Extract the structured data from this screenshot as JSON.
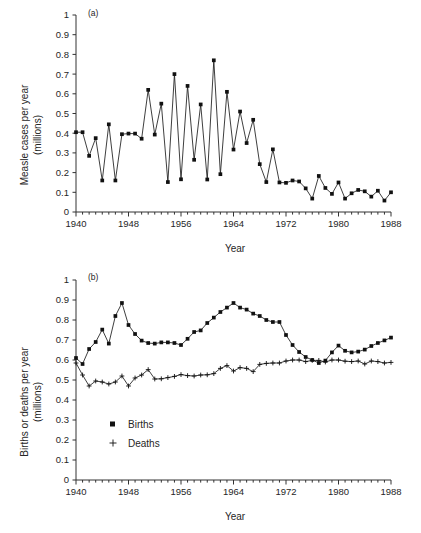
{
  "figure": {
    "width": 421,
    "height": 533,
    "background": "#ffffff",
    "ink_color": "#1c1c1c"
  },
  "panel_a": {
    "tag": "(a)",
    "ylabel_line1": "Measle cases per year",
    "ylabel_line2": "(millions)",
    "xlabel": "Year",
    "ytick_labels": [
      "0",
      "0.1",
      "0.2",
      "0.3",
      "0.4",
      "0.5",
      "0.6",
      "0.7",
      "0.8",
      "0.9",
      "1"
    ],
    "xtick_labels": [
      "1940",
      "1948",
      "1956",
      "1964",
      "1972",
      "1980",
      "1988"
    ]
  },
  "panel_b": {
    "tag": "(b)",
    "ylabel_line1": "Births or deaths per year",
    "ylabel_line2": "(millions)",
    "xlabel": "Year",
    "ytick_labels": [
      "0",
      "0.1",
      "0.2",
      "0.3",
      "0.4",
      "0.5",
      "0.6",
      "0.7",
      "0.8",
      "0.9",
      "1"
    ],
    "xtick_labels": [
      "1940",
      "1948",
      "1956",
      "1964",
      "1972",
      "1980",
      "1988"
    ],
    "legend": [
      {
        "label": "Births",
        "marker": "square"
      },
      {
        "label": "Deaths",
        "marker": "plus"
      }
    ]
  },
  "chart_data": [
    {
      "type": "line",
      "title": "(a) Measles cases per year",
      "xlabel": "Year",
      "ylabel": "Measle cases per year (millions)",
      "xlim": [
        1940,
        1988
      ],
      "ylim": [
        0,
        1
      ],
      "grid": false,
      "legend_position": "none",
      "marker": "filled-square",
      "x": [
        1940,
        1941,
        1942,
        1943,
        1944,
        1945,
        1946,
        1947,
        1948,
        1949,
        1950,
        1951,
        1952,
        1953,
        1954,
        1955,
        1956,
        1957,
        1958,
        1959,
        1960,
        1961,
        1962,
        1963,
        1964,
        1965,
        1966,
        1967,
        1968,
        1969,
        1970,
        1971,
        1972,
        1973,
        1974,
        1975,
        1976,
        1977,
        1978,
        1979,
        1980,
        1981,
        1982,
        1983,
        1984,
        1985,
        1986,
        1987,
        1988
      ],
      "series": [
        {
          "name": "Measles cases",
          "values": [
            0.405,
            0.405,
            0.285,
            0.375,
            0.16,
            0.445,
            0.16,
            0.395,
            0.398,
            0.398,
            0.372,
            0.62,
            0.393,
            0.55,
            0.152,
            0.7,
            0.166,
            0.64,
            0.265,
            0.546,
            0.165,
            0.77,
            0.192,
            0.61,
            0.317,
            0.51,
            0.35,
            0.468,
            0.243,
            0.152,
            0.318,
            0.15,
            0.148,
            0.16,
            0.155,
            0.12,
            0.068,
            0.183,
            0.122,
            0.092,
            0.15,
            0.068,
            0.095,
            0.112,
            0.105,
            0.078,
            0.108,
            0.058,
            0.1
          ]
        }
      ]
    },
    {
      "type": "line",
      "title": "(b) Births or deaths per year",
      "xlabel": "Year",
      "ylabel": "Births or deaths per year (millions)",
      "xlim": [
        1940,
        1988
      ],
      "ylim": [
        0,
        1
      ],
      "grid": false,
      "legend_position": "inside-left",
      "x": [
        1940,
        1941,
        1942,
        1943,
        1944,
        1945,
        1946,
        1947,
        1948,
        1949,
        1950,
        1951,
        1952,
        1953,
        1954,
        1955,
        1956,
        1957,
        1958,
        1959,
        1960,
        1961,
        1962,
        1963,
        1964,
        1965,
        1966,
        1967,
        1968,
        1969,
        1970,
        1971,
        1972,
        1973,
        1974,
        1975,
        1976,
        1977,
        1978,
        1979,
        1980,
        1981,
        1982,
        1983,
        1984,
        1985,
        1986,
        1987,
        1988
      ],
      "series": [
        {
          "name": "Births",
          "marker": "filled-square",
          "values": [
            0.61,
            0.58,
            0.655,
            0.69,
            0.752,
            0.682,
            0.82,
            0.885,
            0.775,
            0.73,
            0.697,
            0.685,
            0.682,
            0.688,
            0.688,
            0.685,
            0.675,
            0.706,
            0.74,
            0.748,
            0.785,
            0.812,
            0.84,
            0.862,
            0.885,
            0.862,
            0.852,
            0.832,
            0.82,
            0.8,
            0.79,
            0.79,
            0.725,
            0.675,
            0.64,
            0.615,
            0.6,
            0.585,
            0.597,
            0.638,
            0.672,
            0.646,
            0.638,
            0.642,
            0.652,
            0.67,
            0.685,
            0.698,
            0.712
          ]
        },
        {
          "name": "Deaths",
          "marker": "plus",
          "values": [
            0.585,
            0.525,
            0.47,
            0.495,
            0.49,
            0.48,
            0.49,
            0.52,
            0.47,
            0.51,
            0.525,
            0.552,
            0.505,
            0.506,
            0.512,
            0.518,
            0.527,
            0.522,
            0.52,
            0.525,
            0.526,
            0.532,
            0.558,
            0.572,
            0.545,
            0.562,
            0.558,
            0.542,
            0.578,
            0.583,
            0.585,
            0.585,
            0.595,
            0.6,
            0.6,
            0.592,
            0.598,
            0.598,
            0.59,
            0.6,
            0.6,
            0.594,
            0.592,
            0.595,
            0.58,
            0.595,
            0.592,
            0.585,
            0.588
          ]
        }
      ]
    }
  ]
}
